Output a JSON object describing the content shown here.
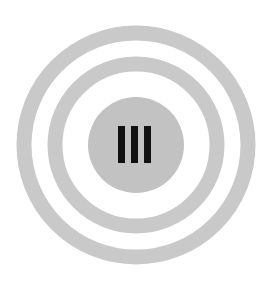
{
  "canvas": {
    "width": 274,
    "height": 286,
    "background_color": "#ffffff"
  },
  "icon": {
    "name": "concentric-rings-target-icon",
    "description": "Three concentric light-gray circular bands with a solid gray center disc containing three black vertical bars",
    "center_x": 136,
    "center_y": 145,
    "ring_color": "#c9c9c9",
    "disc_color": "#c2c2c2",
    "bar_color": "#111111",
    "rings": [
      {
        "name": "outer-ring",
        "radius": 112,
        "stroke_width": 15,
        "color": "#c9c9c9"
      },
      {
        "name": "middle-ring",
        "radius": 81,
        "stroke_width": 15,
        "color": "#c9c9c9"
      }
    ],
    "center_disc": {
      "name": "center-disc",
      "radius": 48,
      "color": "#c2c2c2"
    },
    "bars": {
      "count": 3,
      "width": 7,
      "height": 37,
      "gap": 6,
      "top": 126,
      "color": "#111111",
      "positions_x": [
        118,
        131,
        144
      ]
    }
  }
}
